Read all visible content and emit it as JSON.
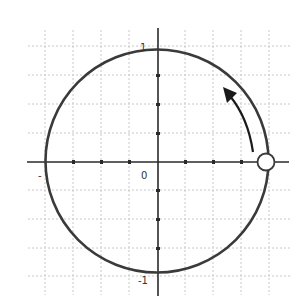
{
  "diagram": {
    "type": "unit-circle",
    "labels": {
      "top": "1",
      "bottom": "-1",
      "left": "-",
      "origin": "0"
    },
    "point": {
      "label": "start-point",
      "x": 1,
      "y": 0,
      "style": "open-circle"
    },
    "arrow": {
      "direction": "counterclockwise"
    },
    "grid": {
      "subdivisions_per_unit": 4,
      "range": [
        -1,
        1
      ]
    },
    "colors": {
      "circle": "#3a3a3a",
      "axes": "#2a2a2a",
      "grid": "#c8c8c8",
      "arrow": "#1a1a1a",
      "point_fill": "#ffffff"
    }
  }
}
